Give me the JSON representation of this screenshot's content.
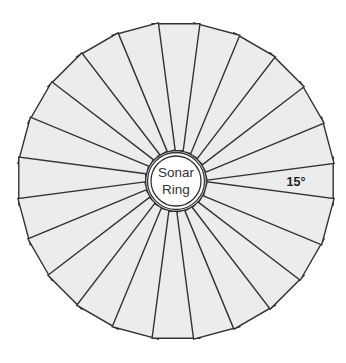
{
  "diagram": {
    "title": "Sonar Ring",
    "center_label_lines": [
      "Sonar",
      "Ring"
    ],
    "segment_count": 24,
    "segment_angle_label": "15°",
    "segment_angle_degrees": 15,
    "colors": {
      "segment_fill": "#ececec",
      "outline": "#333333",
      "background": "#ffffff"
    }
  }
}
